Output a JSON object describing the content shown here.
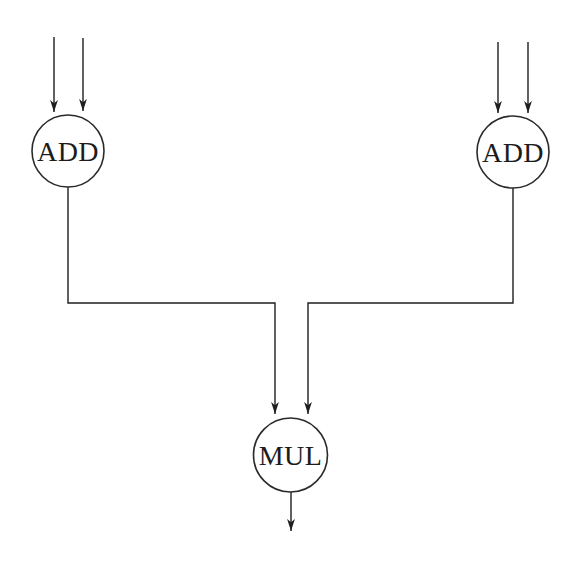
{
  "figure": {
    "background_color": "#ffffff",
    "line_color": "#1f1f1f",
    "nodes": [
      {
        "id": "add-left",
        "label": "ADD",
        "shape": "circle",
        "input_arrows": 2,
        "output_arrows": 1
      },
      {
        "id": "add-right",
        "label": "ADD",
        "shape": "circle",
        "input_arrows": 2,
        "output_arrows": 1
      },
      {
        "id": "mul",
        "label": "MUL",
        "shape": "circle",
        "input_arrows": 2,
        "output_arrows": 1
      }
    ],
    "edges": [
      {
        "from": "external-input-1",
        "to": "add-left"
      },
      {
        "from": "external-input-2",
        "to": "add-left"
      },
      {
        "from": "external-input-3",
        "to": "add-right"
      },
      {
        "from": "external-input-4",
        "to": "add-right"
      },
      {
        "from": "add-left",
        "to": "mul"
      },
      {
        "from": "add-right",
        "to": "mul"
      },
      {
        "from": "mul",
        "to": "external-output"
      }
    ]
  }
}
